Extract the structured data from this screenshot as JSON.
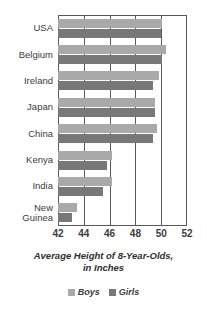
{
  "chart_data": {
    "type": "bar",
    "orientation": "horizontal",
    "title": "Average Height of 8-Year-Olds, in Inches",
    "title_line1": "Average Height of 8-Year-Olds,",
    "title_line2": "in Inches",
    "xlabel": "Average Height of 8-Year-Olds, in Inches",
    "ylabel": "",
    "xlim": [
      42,
      52
    ],
    "xticks": [
      42,
      44,
      46,
      48,
      50,
      52
    ],
    "xtick_labels": [
      "42",
      "44",
      "46",
      "48",
      "50",
      "52"
    ],
    "gridlines": [
      44,
      46,
      48,
      50
    ],
    "grid": true,
    "legend_position": "bottom",
    "categories": [
      "USA",
      "Belgium",
      "Ireland",
      "Japan",
      "China",
      "Kenya",
      "India",
      "New Guinea"
    ],
    "category_labels": [
      "USA",
      "Belgium",
      "Ireland",
      "Japan",
      "China",
      "Kenya",
      "India",
      "New\nGuinea"
    ],
    "series": [
      {
        "name": "Boys",
        "color": "#a9a9a9",
        "values": [
          50.1,
          50.4,
          49.8,
          49.5,
          49.7,
          46.2,
          46.2,
          43.5
        ]
      },
      {
        "name": "Girls",
        "color": "#787878",
        "values": [
          50.0,
          50.1,
          49.4,
          49.5,
          49.4,
          45.8,
          45.5,
          43.1
        ]
      }
    ]
  },
  "legend": {
    "items": [
      {
        "label": "Boys",
        "color": "#a9a9a9"
      },
      {
        "label": "Girls",
        "color": "#787878"
      }
    ]
  },
  "colors": {
    "boys": "#a9a9a9",
    "girls": "#787878",
    "axis": "#5a5a5a",
    "text": "#3b3b3b",
    "background": "#ffffff"
  }
}
